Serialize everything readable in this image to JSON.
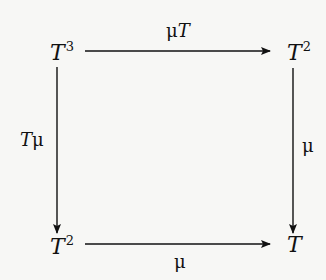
{
  "diagram": {
    "type": "commutative-square",
    "nodes": {
      "top_left": {
        "base": "T",
        "exp": "3"
      },
      "top_right": {
        "base": "T",
        "exp": "2"
      },
      "bottom_left": {
        "base": "T",
        "exp": "2"
      },
      "bottom_right": {
        "base": "T",
        "exp": ""
      }
    },
    "arrows": {
      "top": {
        "from": "T³",
        "to": "T²",
        "label_mu": "μ",
        "label_T": "T"
      },
      "left": {
        "from": "T³",
        "to": "T²",
        "label_T": "T",
        "label_mu": "μ"
      },
      "right": {
        "from": "T²",
        "to": "T",
        "label": "μ"
      },
      "bottom": {
        "from": "T²",
        "to": "T",
        "label": "μ"
      }
    },
    "colors": {
      "ink": "#111111",
      "background": "#f7f7f5"
    }
  }
}
